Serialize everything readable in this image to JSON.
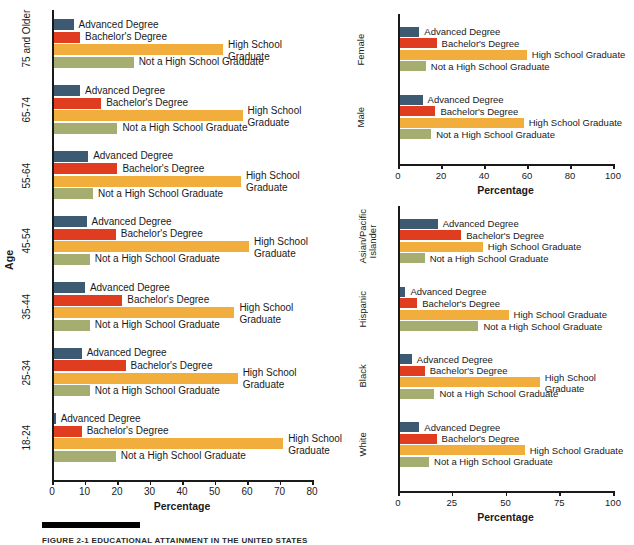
{
  "figure": {
    "caption_label": "FIGURE 2-1  EDUCATIONAL ATTAINMENT IN THE UNITED STATES"
  },
  "colors": {
    "advanced": "#3d5a73",
    "bachelors": "#e03c1f",
    "highschool": "#f2ae3c",
    "nothighschool": "#a6ad70",
    "axis": "#1a1a1a",
    "text": "#1a1a1a"
  },
  "series_labels": {
    "advanced": "Advanced Degree",
    "bachelors": "Bachelor's Degree",
    "highschool": "High School Graduate",
    "highschool_wrapped": "High School\nGraduate",
    "nothighschool": "Not a High School Graduate"
  },
  "chart_data": [
    {
      "id": "age",
      "type": "bar",
      "orientation": "horizontal",
      "title": "",
      "ylabel": "Age",
      "xlabel": "Percentage",
      "xlim": [
        0,
        80
      ],
      "xticks": [
        0,
        10,
        20,
        30,
        40,
        50,
        60,
        70,
        80
      ],
      "xticklabels": [
        "0",
        "10",
        "20",
        "30",
        "40",
        "50",
        "60",
        "70",
        "80"
      ],
      "grid": false,
      "legend": "inline-labels",
      "categories": [
        "75 and Older",
        "65-74",
        "55-64",
        "45-54",
        "35-44",
        "25-34",
        "18-24"
      ],
      "series": [
        {
          "name": "Advanced Degree",
          "key": "advanced",
          "values": [
            6.0,
            8.0,
            10.5,
            10.0,
            9.5,
            8.5,
            0.5
          ]
        },
        {
          "name": "Bachelor's Degree",
          "key": "bachelors",
          "values": [
            8.0,
            14.5,
            19.5,
            19.0,
            21.0,
            22.0,
            8.5
          ]
        },
        {
          "name": "High School Graduate",
          "key": "highschool",
          "values": [
            52.0,
            58.0,
            57.5,
            60.0,
            55.5,
            56.5,
            70.5
          ]
        },
        {
          "name": "Not a High School Graduate",
          "key": "nothighschool",
          "values": [
            24.5,
            19.5,
            12.0,
            11.0,
            11.0,
            11.0,
            19.0
          ]
        }
      ]
    },
    {
      "id": "sex",
      "type": "bar",
      "orientation": "horizontal",
      "title": "",
      "ylabel": "Sex (Age 25 and Older)",
      "xlabel": "Percentage",
      "xlim": [
        0,
        100
      ],
      "xticks": [
        0,
        20,
        40,
        60,
        80,
        100
      ],
      "xticklabels": [
        "0",
        "20",
        "40",
        "60",
        "80",
        "100"
      ],
      "grid": false,
      "legend": "inline-labels",
      "categories": [
        "Female",
        "Male"
      ],
      "series": [
        {
          "name": "Advanced Degree",
          "key": "advanced",
          "values": [
            9.0,
            10.5
          ]
        },
        {
          "name": "Bachelor's Degree",
          "key": "bachelors",
          "values": [
            17.0,
            16.5
          ]
        },
        {
          "name": "High School Graduate",
          "key": "highschool",
          "values": [
            59.0,
            57.5
          ]
        },
        {
          "name": "Not a High School Graduate",
          "key": "nothighschool",
          "values": [
            12.0,
            14.5
          ]
        }
      ]
    },
    {
      "id": "race",
      "type": "bar",
      "orientation": "horizontal",
      "title": "",
      "ylabel": "Race (Age 25 and Older)",
      "xlabel": "Percentage",
      "xlim": [
        0,
        100
      ],
      "xticks": [
        0,
        25,
        50,
        75,
        100
      ],
      "xticklabels": [
        "0",
        "25",
        "50",
        "75",
        "100"
      ],
      "grid": false,
      "legend": "inline-labels",
      "categories": [
        "Asian/Pacific\nIslander",
        "Hispanic",
        "Black",
        "White"
      ],
      "series": [
        {
          "name": "Advanced Degree",
          "key": "advanced",
          "values": [
            17.5,
            2.5,
            5.5,
            9.0
          ]
        },
        {
          "name": "Bachelor's Degree",
          "key": "bachelors",
          "values": [
            28.5,
            8.0,
            11.5,
            17.0
          ]
        },
        {
          "name": "High School Graduate",
          "key": "highschool",
          "values": [
            38.5,
            50.5,
            65.0,
            58.0
          ]
        },
        {
          "name": "Not a High School Graduate",
          "key": "nothighschool",
          "values": [
            11.5,
            36.5,
            16.0,
            13.5
          ]
        }
      ]
    }
  ]
}
